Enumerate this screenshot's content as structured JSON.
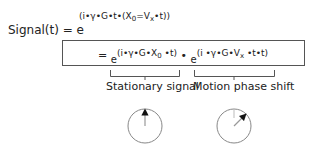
{
  "equation": {
    "lhs": "Signal(t) = e",
    "exponent_pre": "(i•γ•G•t•(X",
    "exponent_sub0": "0",
    "exponent_mid": "=V",
    "exponent_subx": "x",
    "exponent_post": "•t))"
  },
  "expansion": {
    "equals": "=",
    "term1_base": "e",
    "term1_pre": "(i•γ•G•X",
    "term1_sub": "0",
    "term1_post": " •t)",
    "times": "•",
    "term2_base": "e",
    "term2_pre": "(i •γ•G•V",
    "term2_sub": "x",
    "term2_post": " •t•t)"
  },
  "labels": {
    "stationary": "Stationary signal",
    "motion": "Motion phase shift"
  },
  "phasors": [
    {
      "name": "stationary-phasor",
      "angle_deg": 0
    },
    {
      "name": "motion-phasor",
      "angle_deg": 45
    }
  ]
}
